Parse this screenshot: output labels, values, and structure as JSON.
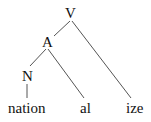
{
  "tree": {
    "nodes": {
      "root": {
        "label": "V"
      },
      "adj": {
        "label": "A"
      },
      "noun": {
        "label": "N"
      },
      "leaf_nation": {
        "label": "nation"
      },
      "leaf_al": {
        "label": "al"
      },
      "leaf_ize": {
        "label": "ize"
      }
    },
    "edges": [
      [
        "V",
        "A"
      ],
      [
        "V",
        "ize"
      ],
      [
        "A",
        "N"
      ],
      [
        "A",
        "al"
      ],
      [
        "N",
        "nation"
      ]
    ],
    "line_color": "#555555",
    "text_color": "#111111"
  }
}
